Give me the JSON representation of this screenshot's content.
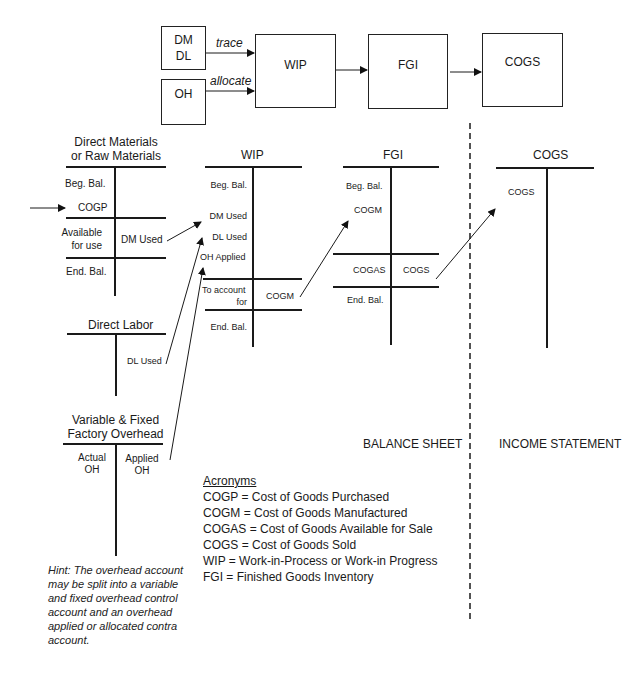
{
  "flow": {
    "dm_dl_box": {
      "line1": "DM",
      "line2": "DL"
    },
    "oh_box": {
      "label": "OH"
    },
    "trace_label": "trace",
    "allocate_label": "allocate",
    "wip_box": {
      "label": "WIP"
    },
    "fgi_box": {
      "label": "FGI"
    },
    "cogs_box": {
      "label": "COGS"
    }
  },
  "accounts": {
    "direct_materials": {
      "title_line1": "Direct Materials",
      "title_line2": "or Raw Materials",
      "debit": [
        "Beg. Bal.",
        "COGP",
        "Available",
        "for use",
        "End. Bal."
      ],
      "credit": [
        "DM Used"
      ]
    },
    "direct_labor": {
      "title": "Direct Labor",
      "credit": [
        "DL Used"
      ]
    },
    "factory_overhead": {
      "title_line1": "Variable & Fixed",
      "title_line2": "Factory Overhead",
      "debit": [
        "Actual",
        "OH"
      ],
      "credit": [
        "Applied",
        "OH"
      ]
    },
    "wip": {
      "title": "WIP",
      "debit": [
        "Beg. Bal.",
        "DM Used",
        "DL Used",
        "OH Applied",
        "To account",
        "for",
        "End. Bal."
      ],
      "credit": [
        "COGM"
      ]
    },
    "fgi": {
      "title": "FGI",
      "debit": [
        "Beg. Bal.",
        "COGM",
        "COGAS",
        "End. Bal."
      ],
      "credit": [
        "COGS"
      ]
    },
    "cogs": {
      "title": "COGS",
      "debit": [
        "COGS"
      ]
    }
  },
  "sections": {
    "balance_sheet": "BALANCE SHEET",
    "income_statement": "INCOME STATEMENT"
  },
  "acronyms": {
    "heading": "Acronyms",
    "items": [
      "COGP = Cost of Goods Purchased",
      "COGM = Cost of Goods Manufactured",
      "COGAS = Cost of Goods Available for Sale",
      "COGS = Cost of Goods Sold",
      "WIP = Work-in-Process or Work-in Progress",
      "FGI = Finished Goods Inventory"
    ]
  },
  "hint": "Hint: The overhead account may be split into a variable and fixed overhead control account and an overhead applied or allocated contra account.",
  "colors": {
    "ink": "#1a1a1a",
    "background": "#ffffff"
  }
}
